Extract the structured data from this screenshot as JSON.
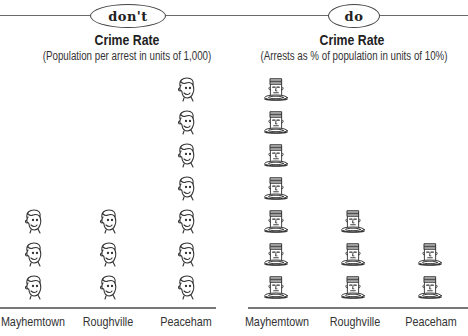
{
  "panels": [
    {
      "badge": "don't",
      "title": "Crime Rate",
      "subtitle": "(Population per arrest in units of 1,000)",
      "icon": "face-icon",
      "categories": [
        "Mayhemtown",
        "Roughville",
        "Peaceham"
      ],
      "counts": [
        3,
        3,
        7
      ]
    },
    {
      "badge": "do",
      "title": "Crime Rate",
      "subtitle": "(Arrests as % of population in units of 10%)",
      "icon": "prisoner-icon",
      "categories": [
        "Mayhemtown",
        "Roughville",
        "Peaceham"
      ],
      "counts": [
        7,
        3,
        2
      ]
    }
  ],
  "chart_data": [
    {
      "type": "bar",
      "style": "pictogram",
      "label": "don't",
      "title": "Crime Rate",
      "subtitle": "(Population per arrest in units of 1,000)",
      "categories": [
        "Mayhemtown",
        "Roughville",
        "Peaceham"
      ],
      "values": [
        3,
        3,
        7
      ],
      "unit": "1,000 population per arrest per icon",
      "xlabel": "",
      "ylabel": "",
      "grid": false,
      "legend": null
    },
    {
      "type": "bar",
      "style": "pictogram",
      "label": "do",
      "title": "Crime Rate",
      "subtitle": "(Arrests as % of population in units of 10%)",
      "categories": [
        "Mayhemtown",
        "Roughville",
        "Peaceham"
      ],
      "values": [
        7,
        3,
        2
      ],
      "unit": "10% of population arrested per icon",
      "xlabel": "",
      "ylabel": "",
      "grid": false,
      "legend": null
    }
  ]
}
